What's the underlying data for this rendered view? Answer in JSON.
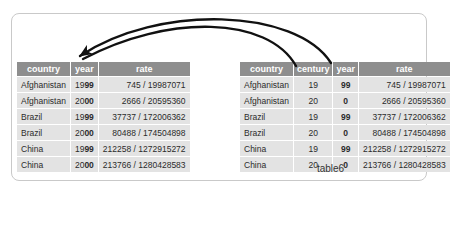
{
  "figure": {
    "caption": "table6"
  },
  "colors": {
    "header_bg": "#8e8e8e",
    "header_text": "#ffffff",
    "cell_bg": "#e3e3e3",
    "cell_text": "#2b2b2b",
    "frame_border": "#c9c9c9",
    "arrow": "#111111"
  },
  "left_table": {
    "columns": [
      {
        "label": "country",
        "align": "left"
      },
      {
        "label": "year",
        "align": "center"
      },
      {
        "label": "rate",
        "align": "right"
      }
    ],
    "rows": [
      [
        "Afghanistan",
        [
          {
            "t": "19"
          },
          {
            "t": "99",
            "b": true
          }
        ],
        "745 / 19987071"
      ],
      [
        "Afghanistan",
        [
          {
            "t": "20"
          },
          {
            "t": "00",
            "b": true
          }
        ],
        "2666 / 20595360"
      ],
      [
        "Brazil",
        [
          {
            "t": "19"
          },
          {
            "t": "99",
            "b": true
          }
        ],
        "37737 / 172006362"
      ],
      [
        "Brazil",
        [
          {
            "t": "20"
          },
          {
            "t": "00",
            "b": true
          }
        ],
        "80488 / 174504898"
      ],
      [
        "China",
        [
          {
            "t": "19"
          },
          {
            "t": "99",
            "b": true
          }
        ],
        "212258 / 1272915272"
      ],
      [
        "China",
        [
          {
            "t": "20"
          },
          {
            "t": "00",
            "b": true
          }
        ],
        "213766 / 1280428583"
      ]
    ]
  },
  "right_table": {
    "columns": [
      {
        "label": "country",
        "align": "left"
      },
      {
        "label": "century",
        "align": "center"
      },
      {
        "label": "year",
        "align": "center"
      },
      {
        "label": "rate",
        "align": "right"
      }
    ],
    "rows": [
      [
        "Afghanistan",
        "19",
        [
          {
            "t": "99",
            "b": true
          }
        ],
        "745 / 19987071"
      ],
      [
        "Afghanistan",
        "20",
        [
          {
            "t": "0",
            "b": true
          }
        ],
        "2666 / 20595360"
      ],
      [
        "Brazil",
        "19",
        [
          {
            "t": "99",
            "b": true
          }
        ],
        "37737 / 172006362"
      ],
      [
        "Brazil",
        "20",
        [
          {
            "t": "0",
            "b": true
          }
        ],
        "80488 / 174504898"
      ],
      [
        "China",
        "19",
        [
          {
            "t": "99",
            "b": true
          }
        ],
        "212258 / 1272915272"
      ],
      [
        "China",
        "20",
        [
          {
            "t": "0",
            "b": true
          }
        ],
        "213766 / 1280428583"
      ]
    ]
  }
}
